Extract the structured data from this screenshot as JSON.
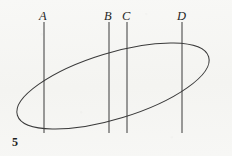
{
  "figure": {
    "number_label": "5",
    "background_color": "#f6f6f4",
    "ink_color": "#3a3a3a"
  },
  "labels": [
    {
      "text": "A",
      "x": 39,
      "y": 10
    },
    {
      "text": "B",
      "x": 104,
      "y": 10
    },
    {
      "text": "C",
      "x": 122,
      "y": 10
    },
    {
      "text": "D",
      "x": 177,
      "y": 10
    }
  ],
  "chart_data": {
    "type": "diagram",
    "title": "",
    "shapes": [
      {
        "name": "ellipse",
        "kind": "ellipse",
        "cx": 113,
        "cy": 86,
        "rx": 100,
        "ry": 33,
        "rotation_deg": -17,
        "stroke": "#3a3a3a",
        "stroke_width": 1,
        "fill": "none"
      },
      {
        "name": "line-A",
        "kind": "line",
        "label": "A",
        "x": 44,
        "y1": 22,
        "y2": 133,
        "stroke": "#3a3a3a",
        "stroke_width": 1
      },
      {
        "name": "line-B",
        "kind": "line",
        "label": "B",
        "x": 109,
        "y1": 22,
        "y2": 133,
        "stroke": "#3a3a3a",
        "stroke_width": 1
      },
      {
        "name": "line-C",
        "kind": "line",
        "label": "C",
        "x": 127,
        "y1": 22,
        "y2": 133,
        "stroke": "#3a3a3a",
        "stroke_width": 1
      },
      {
        "name": "line-D",
        "kind": "line",
        "label": "D",
        "x": 182,
        "y1": 22,
        "y2": 133,
        "stroke": "#3a3a3a",
        "stroke_width": 1
      }
    ],
    "xlabel": "",
    "ylabel": "",
    "grid": false,
    "legend": false
  }
}
